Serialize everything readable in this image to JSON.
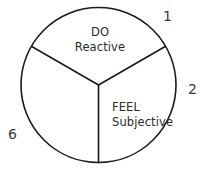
{
  "diagram": {
    "type": "pie-sector-diagram",
    "shape": "circle",
    "stroke_color": "#1a1a1a",
    "fill_color": "#ffffff",
    "text_color": "#2b2b2b",
    "segments": [
      {
        "id": "do",
        "name": "DO",
        "title": "DO",
        "subtitle": "Reactive",
        "position": "top"
      },
      {
        "id": "feel",
        "name": "FEEL",
        "title": "FEEL",
        "subtitle": "Subjective",
        "position": "bottom-right"
      },
      {
        "id": "unlabeled",
        "name": "",
        "title": "",
        "subtitle": "",
        "position": "bottom-left"
      }
    ],
    "callouts": [
      {
        "id": "callout-1",
        "value": "1",
        "position": "top-right"
      },
      {
        "id": "callout-2",
        "value": "2",
        "position": "right"
      },
      {
        "id": "callout-6",
        "value": "6",
        "position": "left"
      }
    ]
  }
}
